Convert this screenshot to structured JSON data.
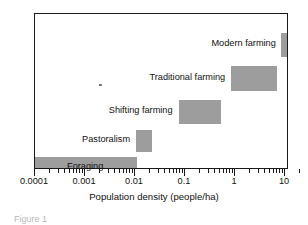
{
  "chart_data": {
    "type": "bar",
    "orientation": "horizontal",
    "title": "",
    "xlabel": "Population density (people/ha)",
    "ylabel": "",
    "xscale": "log",
    "xlim": [
      0.0001,
      20
    ],
    "grid": false,
    "legend": false,
    "bar_color": "#9d9d9d",
    "axis_color": "#1a1a1a",
    "background": "#ffffff",
    "categories": [
      "Foraging",
      "Pastoralism",
      "Shifting farming",
      "Traditional farming",
      "Modern farming"
    ],
    "ranges": [
      {
        "name": "Foraging",
        "start": 0.0001,
        "end": 0.011,
        "label_position": "inside"
      },
      {
        "name": "Pastoralism",
        "start": 0.0105,
        "end": 0.022,
        "label_position": "left"
      },
      {
        "name": "Shifting farming",
        "start": 0.075,
        "end": 0.52,
        "label_position": "left"
      },
      {
        "name": "Traditional farming",
        "start": 0.85,
        "end": 7.0,
        "label_position": "left"
      },
      {
        "name": "Modern farming",
        "start": 8.5,
        "end": 20.0,
        "label_position": "left"
      }
    ],
    "xticks": [
      {
        "value": 0.0001,
        "label": "0.0001"
      },
      {
        "value": 0.001,
        "label": "0.001"
      },
      {
        "value": 0.01,
        "label": "0.01"
      },
      {
        "value": 0.1,
        "label": "0.1"
      },
      {
        "value": 1,
        "label": "1"
      },
      {
        "value": 10,
        "label": "10"
      }
    ],
    "minor_ticks": true
  },
  "labels": {
    "foraging": "Foraging",
    "pastoralism": "Pastoralism",
    "shifting_farming": "Shifting farming",
    "traditional_farming": "Traditional farming",
    "modern_farming": "Modern farming"
  },
  "axis": {
    "title": "Population density (people/ha)",
    "tick_0": "0.0001",
    "tick_1": "0.001",
    "tick_2": "0.01",
    "tick_3": "0.1",
    "tick_4": "1",
    "tick_5": "10"
  },
  "caption": {
    "text": "Figure 1"
  }
}
